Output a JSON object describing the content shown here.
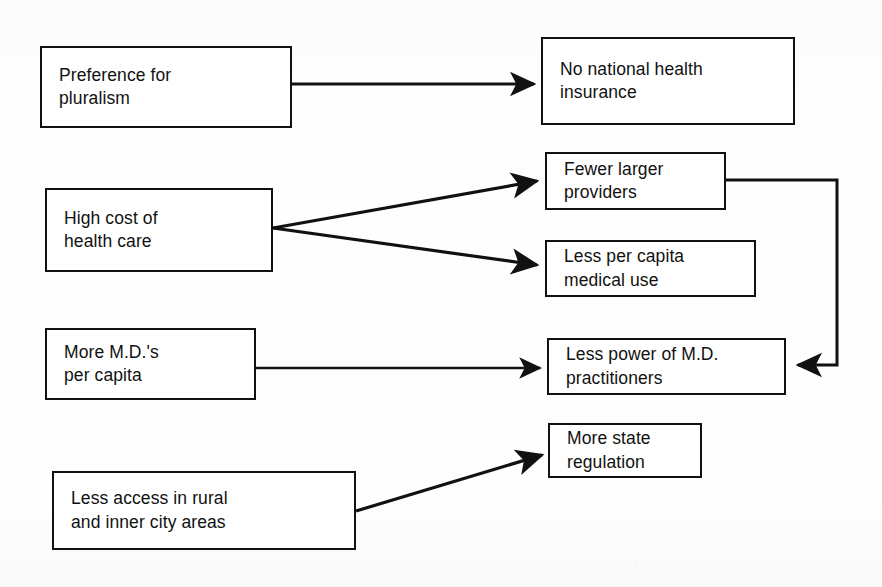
{
  "diagram": {
    "background_color": "#fefefe",
    "line_color": "#111111",
    "text_color": "#111111",
    "nodes": [
      {
        "id": "preference-for-pluralism",
        "label": "Preference for\npluralism",
        "x": 40,
        "y": 46,
        "w": 252,
        "h": 82
      },
      {
        "id": "no-national-health-insurance",
        "label": "No national health\ninsurance",
        "x": 541,
        "y": 37,
        "w": 254,
        "h": 88
      },
      {
        "id": "high-cost-of-health-care",
        "label": "High cost of\nhealth care",
        "x": 45,
        "y": 188,
        "w": 228,
        "h": 84
      },
      {
        "id": "fewer-larger-providers",
        "label": "Fewer larger\nproviders",
        "x": 545,
        "y": 152,
        "w": 181,
        "h": 58
      },
      {
        "id": "less-per-capita-medical-use",
        "label": "Less per capita\nmedical use",
        "x": 545,
        "y": 240,
        "w": 211,
        "h": 57
      },
      {
        "id": "more-mds-per-capita",
        "label": "More M.D.'s\nper capita",
        "x": 45,
        "y": 328,
        "w": 211,
        "h": 72
      },
      {
        "id": "less-power-of-md-practitioners",
        "label": "Less power of M.D.\npractitioners",
        "x": 547,
        "y": 338,
        "w": 239,
        "h": 57
      },
      {
        "id": "more-state-regulation",
        "label": "More state\nregulation",
        "x": 548,
        "y": 423,
        "w": 154,
        "h": 55
      },
      {
        "id": "less-access-rural-inner-city",
        "label": "Less access in rural\nand inner city areas",
        "x": 52,
        "y": 471,
        "w": 304,
        "h": 79
      }
    ],
    "edges": [
      {
        "id": "edge-pluralism-to-no-insurance",
        "from": "preference-for-pluralism",
        "to": "no-national-health-insurance",
        "kind": "straight",
        "points": "292,84 533,84"
      },
      {
        "id": "edge-highcost-to-fewer-providers",
        "from": "high-cost-of-health-care",
        "to": "fewer-larger-providers",
        "kind": "straight",
        "points": "273,228 536,181"
      },
      {
        "id": "edge-highcost-to-less-medical-use",
        "from": "high-cost-of-health-care",
        "to": "less-per-capita-medical-use",
        "kind": "straight",
        "points": "273,228 536,265"
      },
      {
        "id": "edge-more-mds-to-less-power",
        "from": "more-mds-per-capita",
        "to": "less-power-of-md-practitioners",
        "kind": "straight",
        "points": "256,368 539,368"
      },
      {
        "id": "edge-fewer-providers-to-less-power",
        "from": "fewer-larger-providers",
        "to": "less-power-of-md-practitioners",
        "kind": "orthogonal-feedback",
        "points": "726,180 837,180 837,365 796,365"
      },
      {
        "id": "edge-less-access-to-more-regulation",
        "from": "less-access-rural-inner-city",
        "to": "more-state-regulation",
        "kind": "straight",
        "points": "356,511 541,455"
      }
    ]
  }
}
